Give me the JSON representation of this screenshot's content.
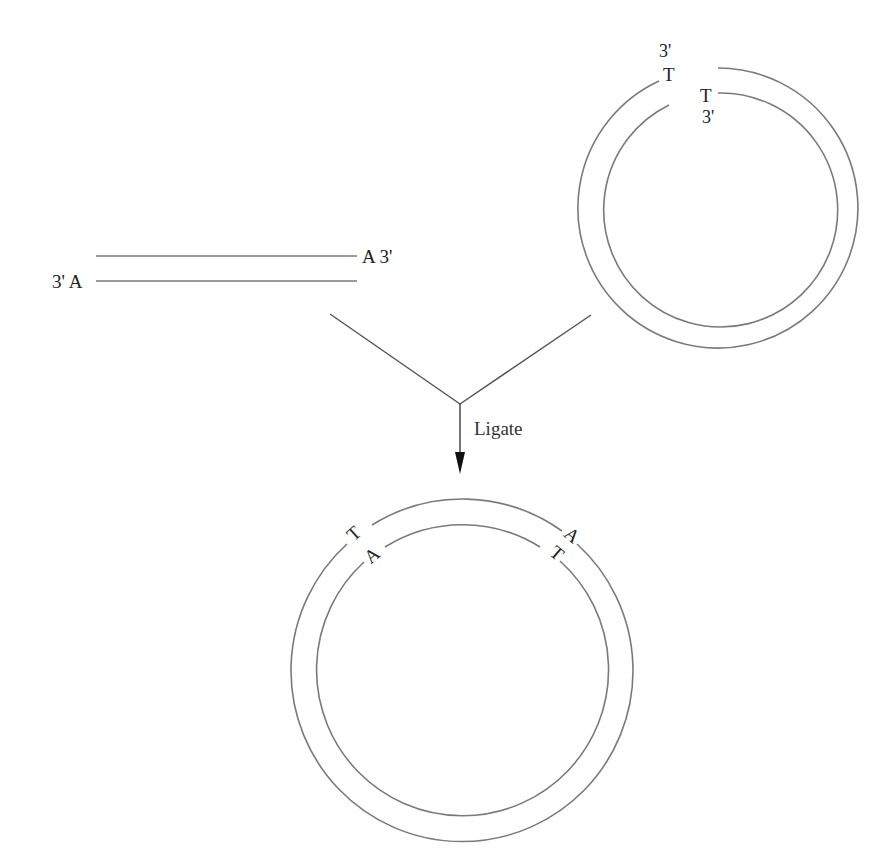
{
  "diagram": {
    "type": "TA cloning ligation schematic",
    "colors": {
      "strand": "#7a7a7a",
      "text": "#222222",
      "arrow": "#111111"
    },
    "insert": {
      "description": "Linear PCR product with 3' A overhangs",
      "top_strand_label": "A 3'",
      "bottom_strand_label": "3' A"
    },
    "vector": {
      "description": "Linearized T-vector with 3' T overhangs",
      "outer_strand_end_prime": "3'",
      "outer_strand_end_base": "T",
      "inner_strand_end_base": "T",
      "inner_strand_end_prime": "3'"
    },
    "step": {
      "label": "Ligate"
    },
    "product": {
      "description": "Recombinant circular plasmid",
      "left_junction": {
        "outer_base": "T",
        "inner_base": "A"
      },
      "right_junction": {
        "outer_base": "A",
        "inner_base": "T"
      }
    }
  }
}
